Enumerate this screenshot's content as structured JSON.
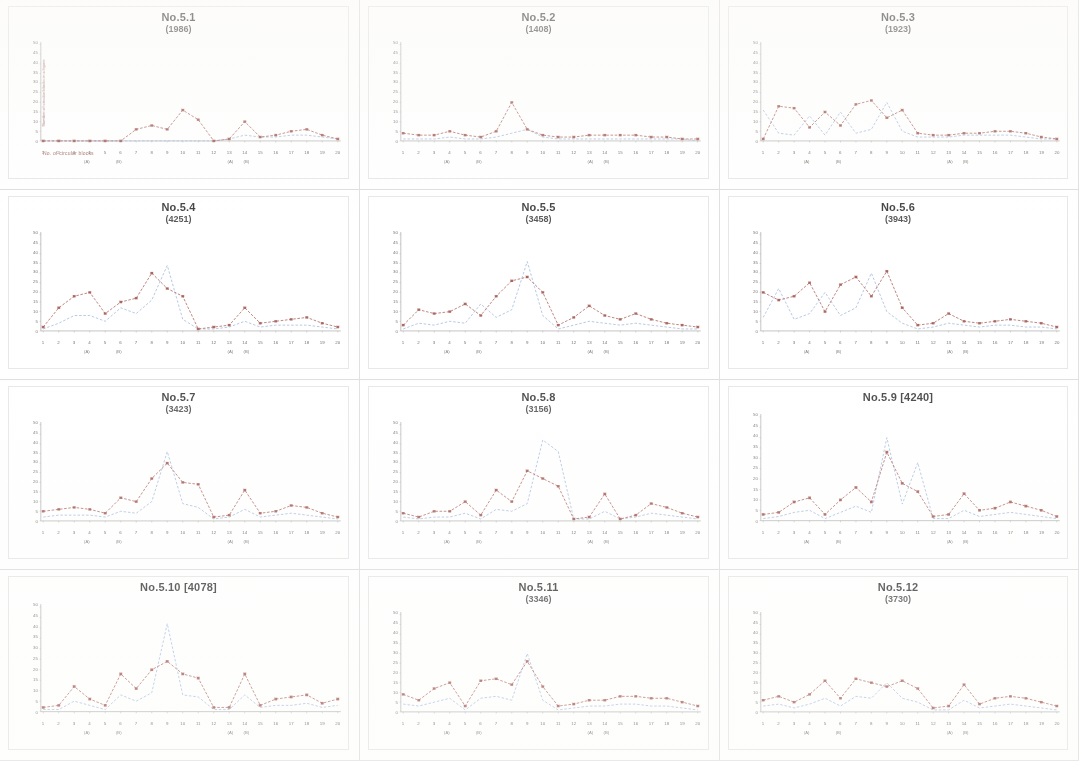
{
  "figure": {
    "layout": {
      "rows": 4,
      "cols": 3
    },
    "axis": {
      "y_title": "Number of circular blocks in a figure",
      "x_caption": "No. of circular blocks",
      "y_ticks": [
        "50",
        "45",
        "40",
        "35",
        "30",
        "25",
        "20",
        "15",
        "10",
        "5",
        "0"
      ],
      "x_ticks": [
        "1",
        "2",
        "3",
        "4",
        "5",
        "6",
        "7",
        "8",
        "9",
        "10",
        "11",
        "12",
        "13",
        "14",
        "15",
        "16",
        "17",
        "18",
        "19",
        "20"
      ],
      "x_sub_ticks": [
        {
          "at": 4,
          "label": "(A)"
        },
        {
          "at": 6,
          "label": "(B)"
        },
        {
          "at": 13,
          "label": "(A)"
        },
        {
          "at": 14,
          "label": "(B)"
        }
      ]
    },
    "colors": {
      "series_primary": "#8e3b35",
      "series_secondary": "#8aa9d6",
      "axis": "#9a9a9a",
      "panel_border": "#e2e2e2",
      "caption": "#8b4a42"
    },
    "legend": [
      {
        "name": "observed",
        "color": "#8e3b35",
        "marker": "square"
      },
      {
        "name": "expected",
        "color": "#8aa9d6",
        "marker": "none"
      }
    ]
  },
  "chart_data": [
    {
      "type": "line",
      "title": "No.5.1",
      "subtitle": "(1986)",
      "title_single_line": false,
      "xlabel": "No. of circular blocks",
      "ylabel": "Number of circular blocks in a figure",
      "x": [
        1,
        2,
        3,
        4,
        5,
        6,
        7,
        8,
        9,
        10,
        11,
        12,
        13,
        14,
        15,
        16,
        17,
        18,
        19,
        20
      ],
      "xlim": [
        1,
        20
      ],
      "ylim": [
        0,
        50
      ],
      "grid": false,
      "series": [
        {
          "name": "observed",
          "color": "#8e3b35",
          "marker": "square",
          "values": [
            0,
            0,
            0,
            0,
            0,
            0,
            6,
            8,
            6,
            16,
            11,
            0,
            1,
            10,
            2,
            3,
            5,
            6,
            3,
            1
          ]
        },
        {
          "name": "expected",
          "color": "#8aa9d6",
          "marker": "none",
          "values": [
            0,
            0,
            0,
            0,
            0,
            0,
            0,
            0,
            0,
            0,
            0,
            0,
            1,
            3,
            2,
            2,
            3,
            3,
            2,
            1
          ]
        }
      ]
    },
    {
      "type": "line",
      "title": "No.5.2",
      "subtitle": "(1408)",
      "title_single_line": false,
      "x": [
        1,
        2,
        3,
        4,
        5,
        6,
        7,
        8,
        9,
        10,
        11,
        12,
        13,
        14,
        15,
        16,
        17,
        18,
        19,
        20
      ],
      "xlim": [
        1,
        20
      ],
      "ylim": [
        0,
        50
      ],
      "grid": false,
      "series": [
        {
          "name": "observed",
          "color": "#8e3b35",
          "marker": "square",
          "values": [
            4,
            3,
            3,
            5,
            3,
            2,
            5,
            20,
            6,
            3,
            2,
            2,
            3,
            3,
            3,
            3,
            2,
            2,
            1,
            1
          ]
        },
        {
          "name": "expected",
          "color": "#8aa9d6",
          "marker": "none",
          "values": [
            1,
            1,
            1,
            2,
            1,
            1,
            2,
            4,
            6,
            2,
            1,
            1,
            1,
            1,
            1,
            1,
            1,
            1,
            1,
            0
          ]
        }
      ]
    },
    {
      "type": "line",
      "title": "No.5.3",
      "subtitle": "(1923)",
      "title_single_line": false,
      "x": [
        1,
        2,
        3,
        4,
        5,
        6,
        7,
        8,
        9,
        10,
        11,
        12,
        13,
        14,
        15,
        16,
        17,
        18,
        19,
        20
      ],
      "xlim": [
        1,
        20
      ],
      "ylim": [
        0,
        50
      ],
      "grid": false,
      "series": [
        {
          "name": "observed",
          "color": "#8e3b35",
          "marker": "square",
          "values": [
            1,
            18,
            17,
            7,
            15,
            8,
            19,
            21,
            12,
            16,
            4,
            3,
            3,
            4,
            4,
            5,
            5,
            4,
            2,
            1
          ]
        },
        {
          "name": "expected",
          "color": "#8aa9d6",
          "marker": "none",
          "values": [
            16,
            4,
            3,
            13,
            3,
            15,
            4,
            6,
            20,
            5,
            2,
            2,
            2,
            3,
            3,
            3,
            3,
            2,
            1,
            1
          ]
        }
      ]
    },
    {
      "type": "line",
      "title": "No.5.4",
      "subtitle": "(4251)",
      "title_single_line": false,
      "x": [
        1,
        2,
        3,
        4,
        5,
        6,
        7,
        8,
        9,
        10,
        11,
        12,
        13,
        14,
        15,
        16,
        17,
        18,
        19,
        20
      ],
      "xlim": [
        1,
        20
      ],
      "ylim": [
        0,
        50
      ],
      "grid": false,
      "series": [
        {
          "name": "observed",
          "color": "#8e3b35",
          "marker": "square",
          "values": [
            2,
            12,
            18,
            20,
            9,
            15,
            17,
            30,
            22,
            18,
            1,
            2,
            3,
            12,
            4,
            5,
            6,
            7,
            4,
            2
          ]
        },
        {
          "name": "expected",
          "color": "#8aa9d6",
          "marker": "none",
          "values": [
            1,
            4,
            8,
            8,
            5,
            12,
            9,
            16,
            34,
            6,
            1,
            1,
            2,
            5,
            2,
            3,
            3,
            3,
            2,
            1
          ]
        }
      ]
    },
    {
      "type": "line",
      "title": "No.5.5",
      "subtitle": "(3458)",
      "title_single_line": false,
      "x": [
        1,
        2,
        3,
        4,
        5,
        6,
        7,
        8,
        9,
        10,
        11,
        12,
        13,
        14,
        15,
        16,
        17,
        18,
        19,
        20
      ],
      "xlim": [
        1,
        50
      ],
      "ylim": [
        0,
        50
      ],
      "grid": false,
      "series": [
        {
          "name": "observed",
          "color": "#8e3b35",
          "marker": "square",
          "values": [
            3,
            11,
            9,
            10,
            14,
            8,
            18,
            26,
            28,
            20,
            3,
            7,
            13,
            8,
            6,
            9,
            6,
            4,
            3,
            2
          ]
        },
        {
          "name": "expected",
          "color": "#8aa9d6",
          "marker": "none",
          "values": [
            1,
            4,
            3,
            5,
            4,
            14,
            7,
            11,
            36,
            8,
            1,
            3,
            5,
            4,
            3,
            4,
            3,
            2,
            1,
            1
          ]
        }
      ]
    },
    {
      "type": "line",
      "title": "No.5.6",
      "subtitle": "(3943)",
      "title_single_line": false,
      "x": [
        1,
        2,
        3,
        4,
        5,
        6,
        7,
        8,
        9,
        10,
        11,
        12,
        13,
        14,
        15,
        16,
        17,
        18,
        19,
        20
      ],
      "xlim": [
        1,
        20
      ],
      "ylim": [
        0,
        50
      ],
      "grid": false,
      "series": [
        {
          "name": "observed",
          "color": "#8e3b35",
          "marker": "square",
          "values": [
            20,
            16,
            18,
            25,
            10,
            24,
            28,
            18,
            31,
            12,
            3,
            4,
            9,
            5,
            4,
            5,
            6,
            5,
            4,
            2
          ]
        },
        {
          "name": "expected",
          "color": "#8aa9d6",
          "marker": "none",
          "values": [
            7,
            22,
            6,
            9,
            20,
            8,
            12,
            30,
            10,
            4,
            1,
            2,
            4,
            3,
            2,
            3,
            3,
            2,
            2,
            1
          ]
        }
      ]
    },
    {
      "type": "line",
      "title": "No.5.7",
      "subtitle": "(3423)",
      "title_single_line": false,
      "x": [
        1,
        2,
        3,
        4,
        5,
        6,
        7,
        8,
        9,
        10,
        11,
        12,
        13,
        14,
        15,
        16,
        17,
        18,
        19,
        20
      ],
      "xlim": [
        1,
        20
      ],
      "ylim": [
        0,
        50
      ],
      "grid": false,
      "series": [
        {
          "name": "observed",
          "color": "#8e3b35",
          "marker": "square",
          "values": [
            5,
            6,
            7,
            6,
            4,
            12,
            10,
            22,
            30,
            20,
            19,
            2,
            3,
            16,
            4,
            5,
            8,
            7,
            4,
            2
          ]
        },
        {
          "name": "expected",
          "color": "#8aa9d6",
          "marker": "none",
          "values": [
            2,
            3,
            3,
            3,
            2,
            5,
            4,
            10,
            36,
            9,
            7,
            1,
            2,
            6,
            2,
            3,
            4,
            3,
            2,
            1
          ]
        }
      ]
    },
    {
      "type": "line",
      "title": "No.5.8",
      "subtitle": "(3156)",
      "title_single_line": false,
      "x": [
        1,
        2,
        3,
        4,
        5,
        6,
        7,
        8,
        9,
        10,
        11,
        12,
        13,
        14,
        15,
        16,
        17,
        18,
        19,
        20
      ],
      "xlim": [
        1,
        20
      ],
      "ylim": [
        0,
        50
      ],
      "grid": false,
      "series": [
        {
          "name": "observed",
          "color": "#8e3b35",
          "marker": "square",
          "values": [
            4,
            2,
            5,
            5,
            10,
            3,
            16,
            10,
            26,
            22,
            18,
            1,
            2,
            14,
            1,
            3,
            9,
            7,
            4,
            2
          ]
        },
        {
          "name": "expected",
          "color": "#8aa9d6",
          "marker": "none",
          "values": [
            2,
            1,
            2,
            2,
            4,
            1,
            6,
            5,
            9,
            42,
            36,
            1,
            1,
            5,
            1,
            2,
            4,
            3,
            2,
            1
          ]
        }
      ]
    },
    {
      "type": "line",
      "title": "No.5.9 [4240]",
      "subtitle": "",
      "title_single_line": true,
      "x": [
        1,
        2,
        3,
        4,
        5,
        6,
        7,
        8,
        9,
        10,
        11,
        12,
        13,
        14,
        15,
        16,
        17,
        18,
        19,
        20
      ],
      "xlim": [
        1,
        20
      ],
      "ylim": [
        0,
        50
      ],
      "grid": false,
      "series": [
        {
          "name": "observed",
          "color": "#8e3b35",
          "marker": "square",
          "values": [
            3,
            4,
            9,
            11,
            3,
            10,
            16,
            9,
            33,
            18,
            14,
            2,
            3,
            13,
            5,
            6,
            9,
            7,
            5,
            2
          ]
        },
        {
          "name": "expected",
          "color": "#8aa9d6",
          "marker": "none",
          "values": [
            1,
            2,
            4,
            5,
            1,
            4,
            7,
            4,
            40,
            8,
            28,
            1,
            1,
            5,
            2,
            3,
            4,
            3,
            2,
            1
          ]
        }
      ]
    },
    {
      "type": "line",
      "title": "No.5.10 [4078]",
      "subtitle": "",
      "title_single_line": true,
      "x": [
        1,
        2,
        3,
        4,
        5,
        6,
        7,
        8,
        9,
        10,
        11,
        12,
        13,
        14,
        15,
        16,
        17,
        18,
        19,
        20
      ],
      "xlim": [
        1,
        20
      ],
      "ylim": [
        0,
        50
      ],
      "grid": false,
      "series": [
        {
          "name": "observed",
          "color": "#8e3b35",
          "marker": "square",
          "values": [
            2,
            3,
            12,
            6,
            3,
            18,
            11,
            20,
            24,
            18,
            16,
            2,
            2,
            18,
            3,
            6,
            7,
            8,
            4,
            6
          ]
        },
        {
          "name": "expected",
          "color": "#8aa9d6",
          "marker": "none",
          "values": [
            1,
            1,
            5,
            3,
            1,
            8,
            5,
            9,
            42,
            8,
            7,
            1,
            1,
            8,
            2,
            3,
            3,
            4,
            2,
            3
          ]
        }
      ]
    },
    {
      "type": "line",
      "title": "No.5.11",
      "subtitle": "(3346)",
      "title_single_line": false,
      "x": [
        1,
        2,
        3,
        4,
        5,
        6,
        7,
        8,
        9,
        10,
        11,
        12,
        13,
        14,
        15,
        16,
        17,
        18,
        19,
        20
      ],
      "xlim": [
        1,
        20
      ],
      "ylim": [
        0,
        50
      ],
      "grid": false,
      "series": [
        {
          "name": "observed",
          "color": "#8e3b35",
          "marker": "square",
          "values": [
            9,
            6,
            12,
            15,
            3,
            16,
            17,
            14,
            26,
            13,
            3,
            4,
            6,
            6,
            8,
            8,
            7,
            7,
            5,
            3
          ]
        },
        {
          "name": "expected",
          "color": "#8aa9d6",
          "marker": "none",
          "values": [
            4,
            3,
            5,
            7,
            1,
            7,
            8,
            6,
            30,
            6,
            1,
            2,
            3,
            3,
            4,
            4,
            3,
            3,
            2,
            1
          ]
        }
      ]
    },
    {
      "type": "line",
      "title": "No.5.12",
      "subtitle": "(3730)",
      "title_single_line": false,
      "x": [
        1,
        2,
        3,
        4,
        5,
        6,
        7,
        8,
        9,
        10,
        11,
        12,
        13,
        14,
        15,
        16,
        17,
        18,
        19,
        20
      ],
      "xlim": [
        1,
        20
      ],
      "ylim": [
        0,
        50
      ],
      "grid": false,
      "series": [
        {
          "name": "observed",
          "color": "#8e3b35",
          "marker": "square",
          "values": [
            6,
            8,
            5,
            9,
            16,
            7,
            17,
            15,
            13,
            16,
            12,
            2,
            3,
            14,
            4,
            7,
            8,
            7,
            5,
            3
          ]
        },
        {
          "name": "expected",
          "color": "#8aa9d6",
          "marker": "none",
          "values": [
            3,
            4,
            2,
            4,
            7,
            3,
            8,
            7,
            15,
            7,
            5,
            1,
            1,
            6,
            2,
            3,
            4,
            3,
            2,
            1
          ]
        }
      ]
    }
  ]
}
